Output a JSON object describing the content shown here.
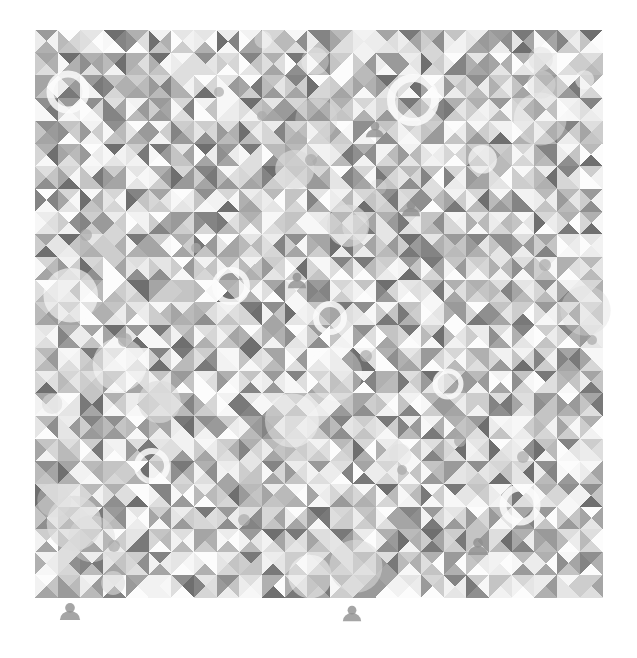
{
  "canvas": {
    "width": 637,
    "height": 658,
    "background": "#ffffff",
    "title": "Generative Triangle Mosaic"
  },
  "artwork": {
    "name": "triangle-mosaic",
    "description": "Square grid of tiles, each subdivided into four triangles meeting at the tile center, filled with randomized grayscale tones, overlaid with scattered circles, rings, dots and user-avatar silhouettes.",
    "grid": {
      "origin_x": 35,
      "origin_y": 30,
      "columns": 25,
      "rows": 25,
      "tile_size": 22.7,
      "extent_x": 602,
      "extent_y": 597
    },
    "tile_motif": "four-triangle-pinwheel",
    "palette": {
      "background": "#ffffff",
      "lightest": "#fbfbfb",
      "light": "#ededed",
      "mid_light": "#dcdcdc",
      "mid": "#c4c4c4",
      "mid_dark": "#a9a9a9",
      "dark": "#8e8e8e",
      "darkest": "#6f6f6f",
      "tint_warm": "#e8e4dc",
      "tint_cool": "#dfe3e6"
    },
    "tone_levels": [
      "#fcfcfc",
      "#f7f7f7",
      "#f2f2f2",
      "#ececec",
      "#e5e5e5",
      "#dedede",
      "#d6d6d6",
      "#cdcdcd",
      "#c4c4c4",
      "#bababa",
      "#b0b0b0",
      "#a5a5a5",
      "#9a9a9a",
      "#8f8f8f",
      "#848484",
      "#797979",
      "#6f6f6f"
    ],
    "overlay_shapes": {
      "circle_count": 26,
      "ring_count": 7,
      "dot_count": 14,
      "avatar_count": 6
    },
    "random_seed": 20240917
  },
  "overlays": {
    "avatars": [
      {
        "cx": 70,
        "cy": 612,
        "r": 11
      },
      {
        "cx": 478,
        "cy": 547,
        "r": 11
      },
      {
        "cx": 375,
        "cy": 130,
        "r": 10
      },
      {
        "cx": 411,
        "cy": 209,
        "r": 10
      },
      {
        "cx": 297,
        "cy": 281,
        "r": 10
      },
      {
        "cx": 352,
        "cy": 614,
        "r": 10
      }
    ],
    "rings": [
      {
        "cx": 68,
        "cy": 92,
        "r": 18,
        "w": 7
      },
      {
        "cx": 413,
        "cy": 100,
        "r": 22,
        "w": 8
      },
      {
        "cx": 231,
        "cy": 286,
        "r": 16,
        "w": 6
      },
      {
        "cx": 330,
        "cy": 318,
        "r": 14,
        "w": 6
      },
      {
        "cx": 520,
        "cy": 505,
        "r": 17,
        "w": 7
      },
      {
        "cx": 152,
        "cy": 466,
        "r": 15,
        "w": 6
      },
      {
        "cx": 448,
        "cy": 384,
        "r": 13,
        "w": 5
      }
    ],
    "dots": [
      {
        "cx": 125,
        "cy": 340,
        "r": 7
      },
      {
        "cx": 262,
        "cy": 116,
        "r": 5
      },
      {
        "cx": 311,
        "cy": 160,
        "r": 6
      },
      {
        "cx": 219,
        "cy": 92,
        "r": 5
      },
      {
        "cx": 545,
        "cy": 265,
        "r": 6
      },
      {
        "cx": 460,
        "cy": 441,
        "r": 6
      },
      {
        "cx": 523,
        "cy": 457,
        "r": 6
      },
      {
        "cx": 86,
        "cy": 235,
        "r": 6
      },
      {
        "cx": 196,
        "cy": 248,
        "r": 5
      },
      {
        "cx": 366,
        "cy": 356,
        "r": 6
      },
      {
        "cx": 592,
        "cy": 340,
        "r": 5
      },
      {
        "cx": 244,
        "cy": 520,
        "r": 6
      },
      {
        "cx": 402,
        "cy": 470,
        "r": 5
      },
      {
        "cx": 114,
        "cy": 546,
        "r": 6
      }
    ]
  }
}
